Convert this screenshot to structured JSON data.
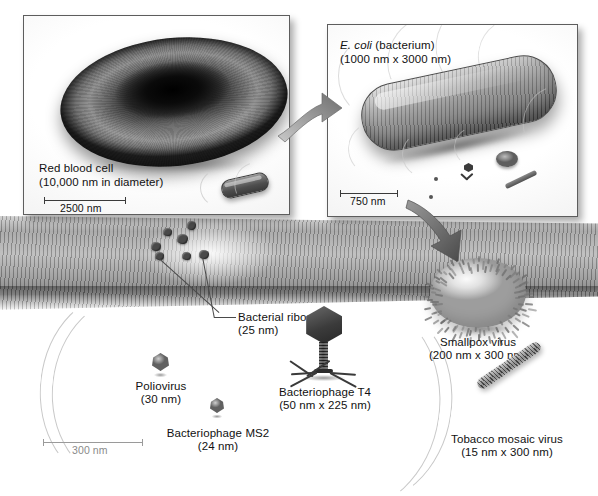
{
  "figure": {
    "background_color": "#ffffff"
  },
  "panels": [
    {
      "id": "red-blood-cell-panel",
      "label": "Red blood cell",
      "size_text": "(10,000 nm in diameter)",
      "scale_bar": "2500 nm"
    },
    {
      "id": "ecoli-panel",
      "label_italic": "E. coli",
      "label_rest": " (bacterium)",
      "size_text": "(1000 nm x 3000 nm)",
      "scale_bar": "750 nm"
    }
  ],
  "specimens": [
    {
      "name": "Bacterial ribosomes",
      "size": "(25 nm)"
    },
    {
      "name": "Poliovirus",
      "size": "(30 nm)"
    },
    {
      "name": "Bacteriophage MS2",
      "size": "(24 nm)"
    },
    {
      "name": "Bacteriophage T4",
      "size": "(50 nm x 225 nm)"
    },
    {
      "name": "Smallpox virus",
      "size": "(200 nm x 300 nm)"
    },
    {
      "name": "Tobacco mosaic virus",
      "size": "(15 nm x 300 nm)"
    }
  ],
  "main_scale_bar": "300 nm",
  "colors": {
    "ink": "#111111",
    "panel_border": "#5d5d5d",
    "arrow_light": "#8f8f8f",
    "arrow_dark": "#5a5a5a"
  }
}
